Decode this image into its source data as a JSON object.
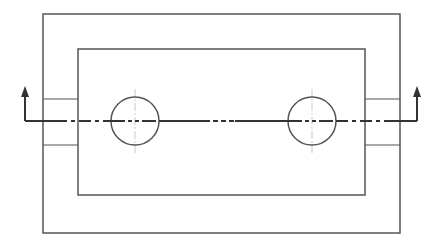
{
  "diagram": {
    "type": "technical-section-view-drawing",
    "width": 442,
    "height": 248,
    "colors": {
      "background": "#ffffff",
      "outline": "#555555",
      "cutting_plane": "#333333",
      "centerline": "#bbbbbb"
    },
    "outer_frame": {
      "x": 43,
      "y": 14,
      "width": 357,
      "height": 219
    },
    "inner_frame": {
      "x": 78,
      "y": 49,
      "width": 287,
      "height": 146
    },
    "left_slot": {
      "x": 43,
      "y": 99,
      "width": 35,
      "height": 46
    },
    "right_slot": {
      "x": 365,
      "y": 99,
      "width": 35,
      "height": 46
    },
    "holes": [
      {
        "name": "left-hole",
        "cx": 135,
        "cy": 121,
        "r": 24
      },
      {
        "name": "right-hole",
        "cx": 312,
        "cy": 121,
        "r": 24
      }
    ],
    "cutting_plane": {
      "y": 121,
      "x_start": 25,
      "x_end": 417,
      "arrow_top_y": 87,
      "left_arrow_x": 25,
      "right_arrow_x": 417
    }
  }
}
